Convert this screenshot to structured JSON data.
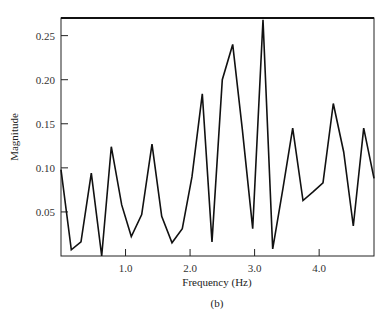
{
  "chart_data": {
    "type": "line",
    "title": "",
    "caption": "(b)",
    "xlabel": "Frequency (Hz)",
    "ylabel": "Magnitude",
    "xlim": [
      0,
      4.85
    ],
    "ylim": [
      0,
      0.27
    ],
    "grid": false,
    "legend": null,
    "xticks": [
      1.0,
      2.0,
      3.0,
      4.0
    ],
    "xtick_labels": [
      "1.0",
      "2.0",
      "3.0",
      "4.0"
    ],
    "yticks": [
      0.05,
      0.1,
      0.15,
      0.2,
      0.25
    ],
    "ytick_labels": [
      "0.05",
      "0.10",
      "0.15",
      "0.20",
      "0.25"
    ],
    "series": [
      {
        "name": "Magnitude",
        "x": [
          0.0,
          0.16,
          0.31,
          0.47,
          0.63,
          0.78,
          0.94,
          1.09,
          1.25,
          1.41,
          1.56,
          1.72,
          1.88,
          2.03,
          2.19,
          2.34,
          2.5,
          2.66,
          2.81,
          2.97,
          3.13,
          3.28,
          3.44,
          3.59,
          3.75,
          3.91,
          4.06,
          4.22,
          4.38,
          4.53,
          4.69,
          4.85
        ],
        "values": [
          0.098,
          0.007,
          0.016,
          0.094,
          0.0,
          0.124,
          0.058,
          0.022,
          0.047,
          0.127,
          0.045,
          0.015,
          0.031,
          0.09,
          0.184,
          0.016,
          0.2,
          0.24,
          0.144,
          0.031,
          0.268,
          0.008,
          0.077,
          0.145,
          0.063,
          0.073,
          0.083,
          0.173,
          0.118,
          0.034,
          0.145,
          0.088
        ]
      }
    ]
  },
  "labels": {
    "xlabel": "Frequency (Hz)",
    "ylabel": "Magnitude",
    "caption": "(b)"
  }
}
